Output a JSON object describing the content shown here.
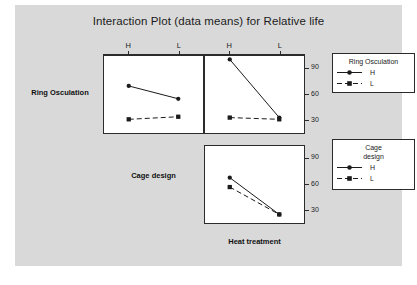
{
  "chart_data": {
    "type": "line",
    "title": "Interaction Plot (data means) for Relative life",
    "subtitle": "",
    "layout": "matrix 2x2 interaction plot; lower-left cell holds the Cage design row title instead of a panel",
    "grid": false,
    "factors": [
      "Ring Osculation",
      "Cage design",
      "Heat treatment"
    ],
    "row_labels": [
      "Ring Osculation",
      "Cage design"
    ],
    "column_label_bottom": "Heat treatment",
    "x_levels": [
      "H",
      "L"
    ],
    "ylabel": "",
    "ylim": [
      15,
      105
    ],
    "yticks": [
      30,
      60,
      90
    ],
    "ytick_labels": [
      "30",
      "60",
      "90"
    ],
    "panels": [
      {
        "id": "r0c0",
        "row": 0,
        "col": 0,
        "x_levels": [
          "H",
          "L"
        ],
        "series": [
          {
            "name": "H",
            "marker": "circle",
            "line": "solid",
            "values": [
              70,
              55
            ]
          },
          {
            "name": "L",
            "marker": "square",
            "line": "dashed",
            "values": [
              31,
              34
            ]
          }
        ]
      },
      {
        "id": "r0c1",
        "row": 0,
        "col": 1,
        "x_levels": [
          "H",
          "L"
        ],
        "series": [
          {
            "name": "H",
            "marker": "circle",
            "line": "solid",
            "values": [
              101,
              33
            ]
          },
          {
            "name": "L",
            "marker": "square",
            "line": "dashed",
            "values": [
              33,
              31
            ]
          }
        ]
      },
      {
        "id": "r1c1",
        "row": 1,
        "col": 1,
        "x_levels": [
          "H",
          "L"
        ],
        "series": [
          {
            "name": "H",
            "marker": "circle",
            "line": "solid",
            "values": [
              68,
              25
            ]
          },
          {
            "name": "L",
            "marker": "square",
            "line": "dashed",
            "values": [
              57,
              25
            ]
          }
        ]
      }
    ],
    "legends": [
      {
        "id": "ring-osculation",
        "title": "Ring Osculation",
        "title_lines": [
          "Ring Osculation"
        ],
        "entries": [
          {
            "label": "H",
            "marker": "circle",
            "line": "solid"
          },
          {
            "label": "L",
            "marker": "square",
            "line": "dashed"
          }
        ]
      },
      {
        "id": "cage-design",
        "title": "Cage design",
        "title_lines": [
          "Cage",
          "design"
        ],
        "entries": [
          {
            "label": "H",
            "marker": "circle",
            "line": "solid"
          },
          {
            "label": "L",
            "marker": "square",
            "line": "dashed"
          }
        ]
      }
    ],
    "colors": {
      "surface_background": "#d9d9d9",
      "panel_background": "#ffffff",
      "axis": "#2b2b2b",
      "series": "#1b1b1b",
      "text": "#1b1b1b"
    }
  }
}
